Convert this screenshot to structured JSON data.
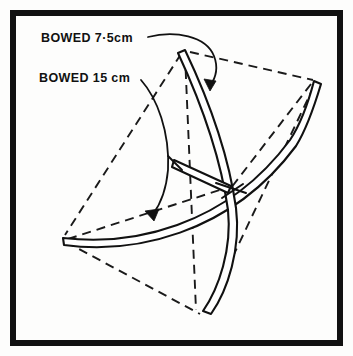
{
  "figure": {
    "background_color": "#fdfdfc",
    "ink_color": "#111111",
    "border": {
      "name": "figure frame border",
      "stroke_width": 6,
      "inset_px": 10
    },
    "annotations": [
      {
        "id": "bowed-7-5",
        "text": "BOWED 7·5cm",
        "value": "7.5",
        "unit": "cm",
        "points_to": "upper bowed member near top vertex"
      },
      {
        "id": "bowed-15",
        "text": "BOWED 15 cm",
        "value": "15",
        "unit": "cm",
        "points_to": "lower bowed member near left vertex"
      }
    ],
    "vertices": [
      {
        "name": "top",
        "x": 185,
        "y": 50
      },
      {
        "name": "right",
        "x": 315,
        "y": 80
      },
      {
        "name": "left",
        "x": 63,
        "y": 238
      },
      {
        "name": "bottom",
        "x": 203,
        "y": 315
      },
      {
        "name": "center-node",
        "x": 228,
        "y": 190
      },
      {
        "name": "strut-upper",
        "x": 175,
        "y": 163
      }
    ],
    "dashed_edges": [
      "top-right",
      "top-left",
      "left-bottom",
      "right-bottom",
      "left-center",
      "right-center",
      "top-center"
    ],
    "bowed_members": [
      {
        "name": "top-to-bottom",
        "bow": "curves right"
      },
      {
        "name": "top-to-center",
        "bow": "curves right"
      },
      {
        "name": "left-to-right",
        "bow": "curves down"
      },
      {
        "name": "center-strut",
        "bow": "straight"
      }
    ]
  }
}
